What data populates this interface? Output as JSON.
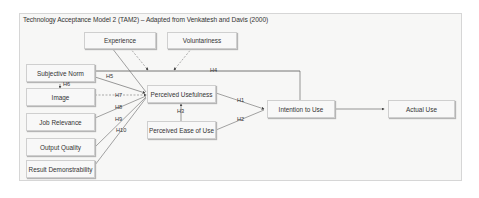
{
  "title": "Technology Acceptance Model 2 (TAM2) – Adapted from Venkatesh and Davis (2000)",
  "nodes": {
    "experience": "Experience",
    "voluntariness": "Voluntariness",
    "subjective_norm": "Subjective Norm",
    "image": "Image",
    "job_relevance": "Job Relevance",
    "output_quality": "Output Quality",
    "result_demonstrability": "Result Demonstrability",
    "perceived_usefulness": "Perceived Usefulness",
    "perceived_ease_of_use": "Perceived Ease of Use",
    "intention_to_use": "Intention to Use",
    "actual_use": "Actual Use"
  },
  "hypotheses": {
    "h1": "H1",
    "h2": "H2",
    "h3": "H3",
    "h4": "H4",
    "h5": "H5",
    "h6": "H6",
    "h7": "H7",
    "h8": "H8",
    "h9": "H9",
    "h10": "H10"
  },
  "colors": {
    "line": "#555555",
    "box_border": "#cfcfcf",
    "background": "#f7f7f6"
  }
}
